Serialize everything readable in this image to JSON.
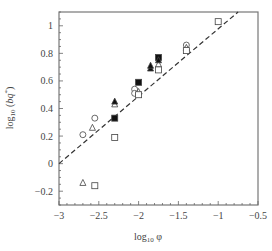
{
  "chart_data": {
    "type": "scatter",
    "title": "",
    "xlabel": "log10 φ",
    "ylabel": "log10 (bq*)",
    "xlim": [
      -3,
      -0.5
    ],
    "ylim": [
      -0.3,
      1.1
    ],
    "xticks": [
      -3,
      -2.5,
      -2,
      -1.5,
      -1,
      -0.5
    ],
    "xtick_labels": [
      "−3",
      "−2.5",
      "−2",
      "−1.5",
      "−1",
      "−0.5"
    ],
    "yticks": [
      -0.2,
      0,
      0.2,
      0.4,
      0.6,
      0.8,
      1
    ],
    "ytick_labels": [
      "−0.2",
      "0",
      "0.2",
      "0.4",
      "0.6",
      "0.8",
      "1"
    ],
    "grid": false,
    "legend": null,
    "series": [
      {
        "name": "open-circle",
        "marker": "circle",
        "filled": false,
        "points": [
          [
            -2.7,
            0.21
          ],
          [
            -2.55,
            0.33
          ],
          [
            -2.05,
            0.54
          ],
          [
            -2.05,
            0.51
          ],
          [
            -1.4,
            0.86
          ]
        ]
      },
      {
        "name": "open-triangle",
        "marker": "triangle",
        "filled": false,
        "points": [
          [
            -2.7,
            -0.14
          ],
          [
            -2.58,
            0.26
          ],
          [
            -2.3,
            0.43
          ],
          [
            -2.0,
            0.52
          ],
          [
            -1.75,
            0.72
          ],
          [
            -1.4,
            0.84
          ]
        ]
      },
      {
        "name": "open-square",
        "marker": "square",
        "filled": false,
        "points": [
          [
            -2.55,
            -0.16
          ],
          [
            -2.3,
            0.19
          ],
          [
            -2.0,
            0.5
          ],
          [
            -1.75,
            0.68
          ],
          [
            -1.4,
            0.82
          ],
          [
            -1.0,
            1.03
          ]
        ]
      },
      {
        "name": "filled-square",
        "marker": "square",
        "filled": true,
        "points": [
          [
            -2.3,
            0.33
          ],
          [
            -2.0,
            0.59
          ],
          [
            -1.75,
            0.77
          ]
        ]
      },
      {
        "name": "filled-triangle",
        "marker": "triangle",
        "filled": true,
        "points": [
          [
            -2.3,
            0.45
          ],
          [
            -1.85,
            0.69
          ],
          [
            -1.85,
            0.71
          ],
          [
            -1.75,
            0.75
          ]
        ]
      }
    ],
    "fit_line": {
      "style": "dashed",
      "x": [
        -3,
        -0.75
      ],
      "y": [
        0,
        1.1
      ],
      "slope": 0.49,
      "intercept": 1.47
    }
  }
}
